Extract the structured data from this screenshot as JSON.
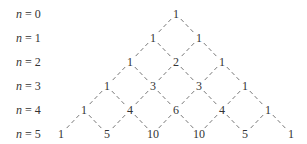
{
  "diagram": {
    "row_labels": [
      {
        "var": "n",
        "eq": " = 0"
      },
      {
        "var": "n",
        "eq": " = 1"
      },
      {
        "var": "n",
        "eq": " = 2"
      },
      {
        "var": "n",
        "eq": " = 3"
      },
      {
        "var": "n",
        "eq": " = 4"
      },
      {
        "var": "n",
        "eq": " = 5"
      }
    ],
    "rows": [
      [
        "1"
      ],
      [
        "1",
        "1"
      ],
      [
        "1",
        "2",
        "1"
      ],
      [
        "1",
        "3",
        "3",
        "1"
      ],
      [
        "1",
        "4",
        "6",
        "4",
        "1"
      ],
      [
        "1",
        "5",
        "10",
        "10",
        "5",
        "1"
      ]
    ],
    "connector_style": "dashed",
    "colors": {
      "text": "#333333",
      "connector": "#555555",
      "background": "#ffffff"
    }
  }
}
